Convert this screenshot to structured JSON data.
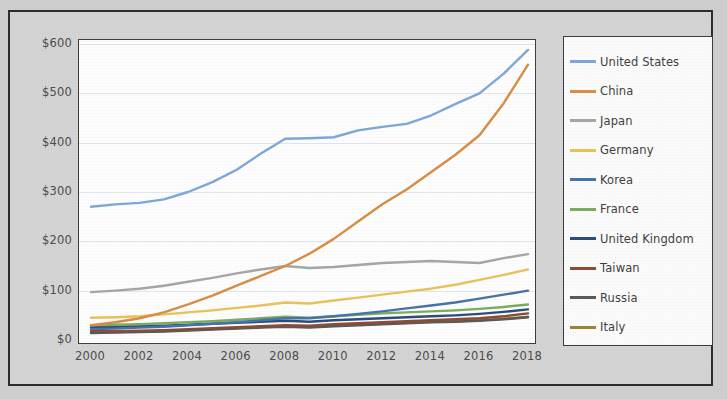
{
  "chart_data": {
    "type": "line",
    "title": "",
    "subtitle": "",
    "xlabel": "",
    "ylabel": "",
    "xlim": [
      2000,
      2018
    ],
    "ylim": [
      0,
      600
    ],
    "grid": true,
    "legend_position": "right",
    "x_tick_labels": [
      "2000",
      "2002",
      "2004",
      "2006",
      "2008",
      "2010",
      "2012",
      "2014",
      "2016",
      "2018"
    ],
    "x_ticks": [
      2000,
      2002,
      2004,
      2006,
      2008,
      2010,
      2012,
      2014,
      2016,
      2018
    ],
    "y_tick_labels": [
      "$0",
      "$100",
      "$200",
      "$300",
      "$400",
      "$500",
      "$600"
    ],
    "y_ticks": [
      0,
      100,
      200,
      300,
      400,
      500,
      600
    ],
    "x": [
      2000,
      2001,
      2002,
      2003,
      2004,
      2005,
      2006,
      2007,
      2008,
      2009,
      2010,
      2011,
      2012,
      2013,
      2014,
      2015,
      2016,
      2017,
      2018
    ],
    "series": [
      {
        "name": "United States",
        "color": "#7ca6d8",
        "values": [
          270,
          275,
          278,
          285,
          300,
          320,
          345,
          378,
          408,
          409,
          411,
          425,
          432,
          438,
          455,
          478,
          500,
          540,
          588
        ]
      },
      {
        "name": "China",
        "color": "#d98b43",
        "values": [
          30,
          36,
          44,
          56,
          72,
          90,
          110,
          130,
          150,
          175,
          205,
          240,
          275,
          305,
          340,
          375,
          415,
          480,
          558
        ]
      },
      {
        "name": "Japan",
        "color": "#a5a5a5",
        "values": [
          97,
          100,
          104,
          110,
          118,
          126,
          135,
          143,
          150,
          146,
          148,
          152,
          156,
          158,
          160,
          158,
          156,
          166,
          174
        ]
      },
      {
        "name": "Germany",
        "color": "#e8c25a",
        "values": [
          45,
          46,
          48,
          52,
          56,
          60,
          65,
          70,
          76,
          74,
          80,
          86,
          92,
          98,
          104,
          112,
          122,
          132,
          143
        ]
      },
      {
        "name": "Korea",
        "color": "#4472a8",
        "values": [
          22,
          23,
          25,
          27,
          30,
          33,
          36,
          40,
          44,
          44,
          48,
          53,
          58,
          64,
          70,
          76,
          84,
          92,
          100
        ]
      },
      {
        "name": "France",
        "color": "#7ba košík"
      }
    ]
  },
  "axes": {
    "y_labels": [
      "$600",
      "$500",
      "$400",
      "$300",
      "$200",
      "$100",
      "$0"
    ],
    "x_labels": [
      "2000",
      "2002",
      "2004",
      "2006",
      "2008",
      "2010",
      "2012",
      "2014",
      "2016",
      "2018"
    ]
  },
  "legend": {
    "items": [
      {
        "label": "United States",
        "color": "#7ca6d8"
      },
      {
        "label": "China",
        "color": "#d98b43"
      },
      {
        "label": "Japan",
        "color": "#a5a5a5"
      },
      {
        "label": "Germany",
        "color": "#e8c25a"
      },
      {
        "label": "Korea",
        "color": "#4472a8"
      },
      {
        "label": "France",
        "color": "#7bab5c"
      },
      {
        "label": "United Kingdom",
        "color": "#2b4a7d"
      },
      {
        "label": "Taiwan",
        "color": "#8d4a2e"
      },
      {
        "label": "Russia",
        "color": "#585858"
      },
      {
        "label": "Italy",
        "color": "#9a8334"
      }
    ]
  }
}
